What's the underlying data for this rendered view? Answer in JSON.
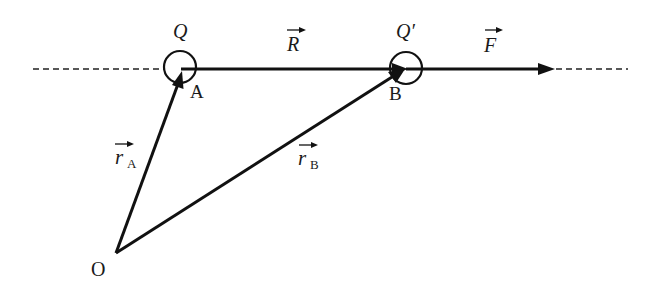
{
  "diagram": {
    "colors": {
      "stroke": "#111111",
      "background": "#ffffff"
    },
    "points": {
      "O": {
        "label": "O",
        "x": 116,
        "y": 253
      },
      "A": {
        "label": "A",
        "x": 182,
        "y": 69
      },
      "B": {
        "label": "B",
        "x": 405,
        "y": 69
      }
    },
    "charges": {
      "Q": {
        "label": "Q",
        "cx": 180,
        "cy": 67,
        "r": 16
      },
      "Qprime": {
        "label": "Q′",
        "cx": 406,
        "cy": 68,
        "r": 16
      }
    },
    "vectors": {
      "r_A": {
        "symbol": "r",
        "subscript": "A",
        "from": "O",
        "to": "A"
      },
      "r_B": {
        "symbol": "r",
        "subscript": "B",
        "from": "O",
        "to": "B"
      },
      "R": {
        "symbol": "R",
        "from": "A",
        "to": "B"
      },
      "F": {
        "symbol": "F",
        "from": "B",
        "to_x": 553
      }
    },
    "line_of_action": {
      "y": 69,
      "dashed_left": [
        33,
        164
      ],
      "dashed_right": [
        553,
        628
      ]
    }
  }
}
